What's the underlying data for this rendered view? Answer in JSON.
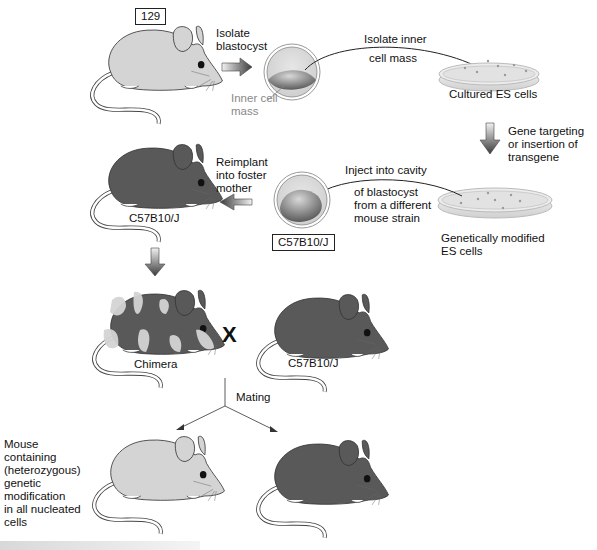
{
  "diagram": {
    "colors": {
      "light_mouse": "#d4d4d4",
      "dark_mouse": "#595959",
      "outline": "#333333",
      "arrow_dark": "#3a3a3a",
      "arrow_light": "#f0f0f0",
      "grey_text": "#888888"
    },
    "strain_labels": {
      "donor": "129",
      "recipient_blastocyst": "C57B10/J",
      "foster_mother": "C57B10/J",
      "mate": "C57B10/J"
    },
    "steps": {
      "isolate_blastocyst": [
        "Isolate",
        "blastocyst"
      ],
      "inner_cell_mass": [
        "Inner cell",
        "mass"
      ],
      "isolate_icm": [
        "Isolate inner",
        "cell mass"
      ],
      "cultured_es": "Cultured ES cells",
      "gene_targeting": [
        "Gene targeting",
        "or insertion of",
        "transgene"
      ],
      "genetically_modified": [
        "Genetically modified",
        "ES cells"
      ],
      "inject": [
        "Inject into cavity",
        "of blastocyst",
        "from a different",
        "mouse strain"
      ],
      "reimplant": [
        "Reimplant",
        "into foster",
        "mother"
      ],
      "chimera": "Chimera",
      "cross_symbol": "X",
      "mating": "Mating",
      "offspring_note": [
        "Mouse",
        "containing",
        "(heterozygous)",
        "genetic",
        "modification",
        "in all nucleated",
        "cells"
      ]
    }
  }
}
